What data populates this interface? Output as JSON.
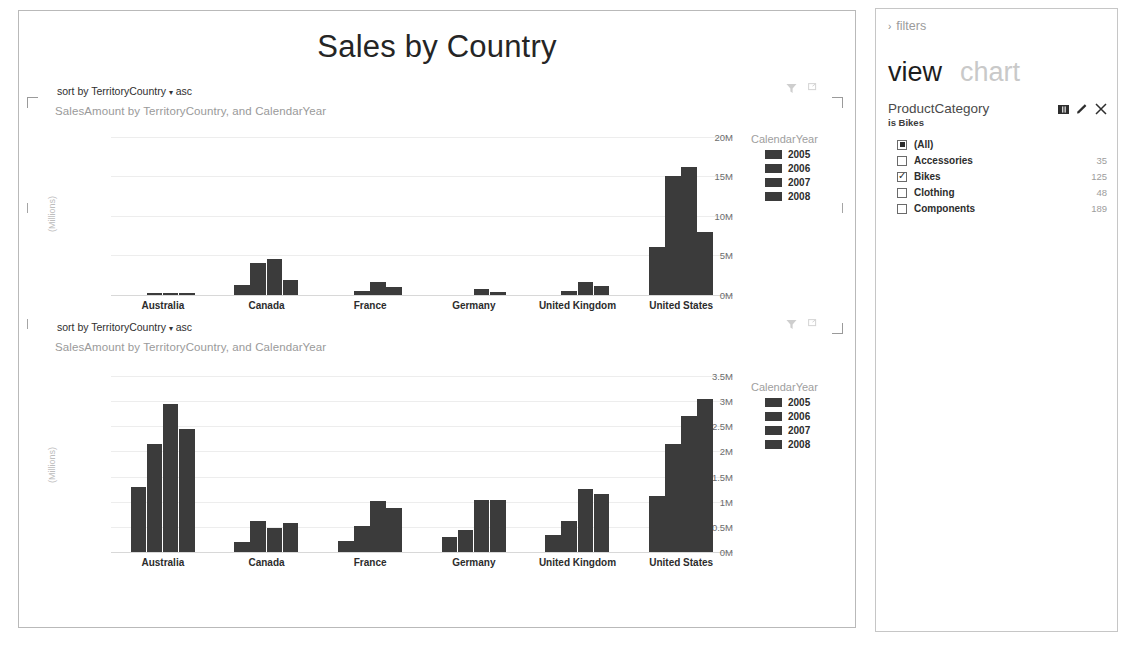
{
  "report": {
    "title": "Sales by Country"
  },
  "visuals": [
    {
      "sort_prefix": "sort by",
      "sort_field": "TerritoryCountry",
      "sort_caret": "▾",
      "sort_dir": "asc",
      "subtitle": "SalesAmount by TerritoryCountry, and CalendarYear",
      "filter_icon": "filter-funnel-icon",
      "popout_icon": "pop-out-icon"
    },
    {
      "sort_prefix": "sort by",
      "sort_field": "TerritoryCountry",
      "sort_caret": "▾",
      "sort_dir": "asc",
      "subtitle": "SalesAmount by TerritoryCountry, and CalendarYear",
      "filter_icon": "filter-funnel-icon",
      "popout_icon": "pop-out-icon"
    }
  ],
  "sidebar": {
    "breadcrumb": "filters",
    "breadcrumb_chevron": "›",
    "tab_active": "view",
    "tab_inactive": "chart",
    "filter_card": {
      "field": "ProductCategory",
      "condition": "is Bikes",
      "icons": [
        "columns-icon",
        "pencil-edit-icon",
        "close-x-icon"
      ],
      "items": [
        {
          "label": "(All)",
          "count": "",
          "state": "partial"
        },
        {
          "label": "Accessories",
          "count": "35",
          "state": "unchecked"
        },
        {
          "label": "Bikes",
          "count": "125",
          "state": "checked"
        },
        {
          "label": "Clothing",
          "count": "48",
          "state": "unchecked"
        },
        {
          "label": "Components",
          "count": "189",
          "state": "unchecked"
        }
      ]
    }
  },
  "colors": {
    "bar": "#3b3b3b",
    "gridline": "#ededed",
    "axis_text": "#6d6d6d",
    "muted_text": "#9a9a9a"
  },
  "chart_data": [
    {
      "type": "bar",
      "title": "SalesAmount by TerritoryCountry, and CalendarYear",
      "xlabel": "",
      "ylabel": "(Millions)",
      "ylim": [
        0,
        21000000
      ],
      "yticks": [
        0,
        5000000,
        10000000,
        15000000,
        20000000
      ],
      "ytick_labels": [
        "0M",
        "5M",
        "10M",
        "15M",
        "20M"
      ],
      "grid": true,
      "legend_title": "CalendarYear",
      "legend_position": "right",
      "categories": [
        "Australia",
        "Canada",
        "France",
        "Germany",
        "United Kingdom",
        "United States"
      ],
      "series": [
        {
          "name": "2005",
          "values": [
            0,
            1300000,
            0,
            0,
            0,
            6100000
          ]
        },
        {
          "name": "2006",
          "values": [
            300000,
            4100000,
            500000,
            0,
            500000,
            15000000
          ]
        },
        {
          "name": "2007",
          "values": [
            300000,
            4500000,
            1700000,
            700000,
            1700000,
            16200000
          ]
        },
        {
          "name": "2008",
          "values": [
            300000,
            1900000,
            1000000,
            400000,
            1100000,
            8000000
          ]
        }
      ]
    },
    {
      "type": "bar",
      "title": "SalesAmount by TerritoryCountry, and CalendarYear",
      "xlabel": "",
      "ylabel": "(Millions)",
      "ylim": [
        0,
        3600000
      ],
      "yticks": [
        0,
        500000,
        1000000,
        1500000,
        2000000,
        2500000,
        3000000,
        3500000
      ],
      "ytick_labels": [
        "0M",
        "0.5M",
        "1M",
        "1.5M",
        "2M",
        "2.5M",
        "3M",
        "3.5M"
      ],
      "grid": true,
      "legend_title": "CalendarYear",
      "legend_position": "right",
      "categories": [
        "Australia",
        "Canada",
        "France",
        "Germany",
        "United Kingdom",
        "United States"
      ],
      "series": [
        {
          "name": "2005",
          "values": [
            1300000,
            200000,
            220000,
            290000,
            330000,
            1120000
          ]
        },
        {
          "name": "2006",
          "values": [
            2150000,
            620000,
            520000,
            430000,
            620000,
            2150000
          ]
        },
        {
          "name": "2007",
          "values": [
            2950000,
            470000,
            1020000,
            1040000,
            1250000,
            2700000
          ]
        },
        {
          "name": "2008",
          "values": [
            2450000,
            580000,
            880000,
            1040000,
            1150000,
            3050000
          ]
        }
      ]
    }
  ]
}
